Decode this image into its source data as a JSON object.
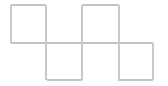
{
  "figure": {
    "width": 168,
    "height": 86,
    "background_color": "#ffffff",
    "line_color": "#c9c9c9",
    "line_color_strong": "#b8b8b8",
    "line_width": 1.6
  },
  "grid": {
    "top_row_label": "top row",
    "bottom_row_label": "bottom row",
    "x_positions_top": [
      11,
      46,
      82,
      119
    ],
    "x_positions_bottom": [
      46,
      82,
      119,
      153
    ],
    "y_top": 5,
    "y_middle": 43,
    "y_bottom": 80,
    "cell_count_top": 3,
    "cell_count_bottom": 3
  },
  "segments": [
    {
      "name": "top-edge-cell-1",
      "orientation": "horizontal",
      "x1": 11,
      "y1": 5,
      "x2": 46,
      "y2": 5,
      "color": "#c4c4c4"
    },
    {
      "name": "top-edge-cell-3",
      "orientation": "horizontal",
      "x1": 82,
      "y1": 5,
      "x2": 119,
      "y2": 5,
      "color": "#c4c4c4"
    },
    {
      "name": "top-vertical-1",
      "orientation": "vertical",
      "x1": 11,
      "y1": 5,
      "x2": 11,
      "y2": 43,
      "color": "#c9c9c9"
    },
    {
      "name": "top-vertical-2",
      "orientation": "vertical",
      "x1": 46,
      "y1": 5,
      "x2": 46,
      "y2": 43,
      "color": "#c9c9c9"
    },
    {
      "name": "top-vertical-3",
      "orientation": "vertical",
      "x1": 82,
      "y1": 5,
      "x2": 82,
      "y2": 43,
      "color": "#c9c9c9"
    },
    {
      "name": "top-vertical-4",
      "orientation": "vertical",
      "x1": 119,
      "y1": 5,
      "x2": 119,
      "y2": 43,
      "color": "#c9c9c9"
    },
    {
      "name": "middle-horizontal-span",
      "orientation": "horizontal",
      "x1": 11,
      "y1": 43,
      "x2": 153,
      "y2": 43,
      "color": "#c4c4c4"
    },
    {
      "name": "bottom-vertical-1",
      "orientation": "vertical",
      "x1": 46,
      "y1": 43,
      "x2": 46,
      "y2": 80,
      "color": "#c9c9c9"
    },
    {
      "name": "bottom-vertical-2",
      "orientation": "vertical",
      "x1": 82,
      "y1": 43,
      "x2": 82,
      "y2": 80,
      "color": "#c9c9c9"
    },
    {
      "name": "bottom-vertical-3",
      "orientation": "vertical",
      "x1": 119,
      "y1": 43,
      "x2": 119,
      "y2": 80,
      "color": "#c9c9c9"
    },
    {
      "name": "bottom-vertical-4",
      "orientation": "vertical",
      "x1": 153,
      "y1": 43,
      "x2": 153,
      "y2": 80,
      "color": "#c9c9c9"
    },
    {
      "name": "bottom-edge-cell-1",
      "orientation": "horizontal",
      "x1": 47,
      "y1": 80,
      "x2": 82,
      "y2": 80,
      "color": "#c4c4c4"
    },
    {
      "name": "bottom-edge-cell-3",
      "orientation": "horizontal",
      "x1": 118,
      "y1": 80,
      "x2": 153,
      "y2": 80,
      "color": "#c4c4c4"
    }
  ]
}
